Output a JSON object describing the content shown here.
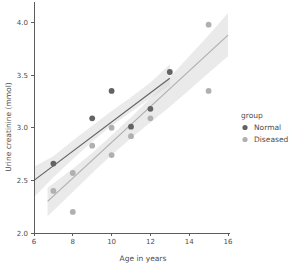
{
  "chart_data": {
    "type": "scatter",
    "title": "",
    "xlabel": "Age in years",
    "ylabel": "Urine creatinine (mmol)",
    "xlim": [
      6,
      16
    ],
    "ylim": [
      2.0,
      4.1
    ],
    "xticks": [
      6,
      8,
      10,
      12,
      14,
      16
    ],
    "xtick_labels": [
      "6",
      "8",
      "10",
      "12",
      "14",
      "16"
    ],
    "yticks": [
      2.0,
      2.5,
      3.0,
      3.5,
      4.0
    ],
    "ytick_labels": [
      "2.0",
      "2.5",
      "3.0",
      "3.5",
      "4.0"
    ],
    "grid": false,
    "legend": {
      "title": "group",
      "position": "right",
      "entries": [
        {
          "label": "Normal",
          "color": "#636363"
        },
        {
          "label": "Diseased",
          "color": "#b0b0b0"
        }
      ]
    },
    "series": [
      {
        "name": "Normal",
        "color": "#636363",
        "marker": "circle",
        "points": [
          {
            "x": 7,
            "y": 2.66
          },
          {
            "x": 9,
            "y": 3.09
          },
          {
            "x": 10,
            "y": 3.35
          },
          {
            "x": 11,
            "y": 3.01
          },
          {
            "x": 12,
            "y": 3.18
          },
          {
            "x": 13,
            "y": 3.53
          }
        ],
        "fit": {
          "type": "linear",
          "x_start": 6.0,
          "x_end": 13.0,
          "y_start": 2.5,
          "y_end": 3.47,
          "ci_band": {
            "x": [
              6.0,
              7.0,
              8.0,
              9.0,
              10.0,
              11.0,
              12.0,
              13.0
            ],
            "upper": [
              2.63,
              2.73,
              2.88,
              3.02,
              3.16,
              3.29,
              3.43,
              3.6
            ],
            "lower": [
              2.34,
              2.53,
              2.7,
              2.87,
              3.02,
              3.15,
              3.28,
              3.4
            ]
          }
        }
      },
      {
        "name": "Diseased",
        "color": "#b0b0b0",
        "marker": "circle",
        "points": [
          {
            "x": 7,
            "y": 2.4
          },
          {
            "x": 8,
            "y": 2.2
          },
          {
            "x": 8,
            "y": 2.57
          },
          {
            "x": 9,
            "y": 2.83
          },
          {
            "x": 10,
            "y": 3.0
          },
          {
            "x": 10,
            "y": 2.74
          },
          {
            "x": 11,
            "y": 2.92
          },
          {
            "x": 12,
            "y": 3.09
          },
          {
            "x": 15,
            "y": 3.98
          },
          {
            "x": 15,
            "y": 3.35
          }
        ],
        "fit": {
          "type": "linear",
          "x_start": 6.7,
          "x_end": 16.0,
          "y_start": 2.3,
          "y_end": 3.88,
          "ci_band": {
            "x": [
              6.7,
              8.0,
              9.0,
              10.0,
              11.0,
              12.0,
              13.0,
              14.0,
              15.0,
              16.0
            ],
            "upper": [
              2.43,
              2.61,
              2.76,
              2.93,
              3.1,
              3.28,
              3.48,
              3.68,
              3.88,
              4.09
            ],
            "lower": [
              2.16,
              2.39,
              2.57,
              2.74,
              2.9,
              3.05,
              3.2,
              3.36,
              3.52,
              3.68
            ]
          }
        }
      }
    ]
  }
}
